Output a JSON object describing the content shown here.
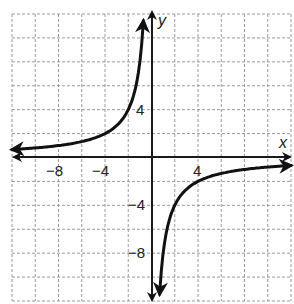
{
  "chart_data": {
    "type": "line",
    "title": "",
    "function": "y = -8/x",
    "xlabel": "x",
    "ylabel": "y",
    "xlim": [
      -12,
      12
    ],
    "ylim": [
      -12,
      12
    ],
    "grid": true,
    "grid_step": 2,
    "x_tick_labels": [
      {
        "value": -8,
        "label": "−8"
      },
      {
        "value": -4,
        "label": "−4"
      },
      {
        "value": 4,
        "label": "4"
      }
    ],
    "y_tick_labels": [
      {
        "value": 4,
        "label": "4"
      },
      {
        "value": -4,
        "label": "−4"
      },
      {
        "value": -8,
        "label": "−8"
      }
    ],
    "series": [
      {
        "name": "left branch",
        "x": [
          -12,
          -10,
          -8,
          -6,
          -4,
          -3,
          -2,
          -1.5,
          -1,
          -0.8,
          -0.7
        ],
        "y": [
          0.67,
          0.8,
          1,
          1.33,
          2,
          2.67,
          4,
          5.33,
          8,
          10,
          11.4
        ]
      },
      {
        "name": "right branch",
        "x": [
          0.7,
          0.8,
          1,
          1.5,
          2,
          3,
          4,
          6,
          8,
          10,
          12
        ],
        "y": [
          -11.4,
          -10,
          -8,
          -5.33,
          -4,
          -2.67,
          -2,
          -1.33,
          -1,
          -0.8,
          -0.67
        ]
      }
    ],
    "asymptotes": {
      "vertical": 0,
      "horizontal": 0
    },
    "legend": null
  },
  "labels": {
    "x_axis": "x",
    "y_axis": "y",
    "x_neg8": "−8",
    "x_neg4": "−4",
    "x_pos4": "4",
    "y_pos4": "4",
    "y_neg4": "−4",
    "y_neg8": "−8"
  }
}
